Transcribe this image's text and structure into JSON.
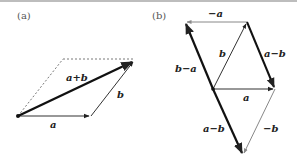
{
  "figure": {
    "panel_a": {
      "label": "(a)",
      "vectors": {
        "a": "a",
        "b": "b",
        "sum": "a+b"
      }
    },
    "panel_b": {
      "label": "(b)",
      "vectors": {
        "neg_a": "−a",
        "b": "b",
        "a_minus_b_top": "a−b",
        "b_minus_a": "b−a",
        "a": "a",
        "a_minus_b_bottom": "a−b",
        "neg_b": "−b"
      }
    },
    "colors": {
      "thick": "#111111",
      "thin": "#333333",
      "gray": "#888888",
      "dashed": "#555555"
    }
  }
}
